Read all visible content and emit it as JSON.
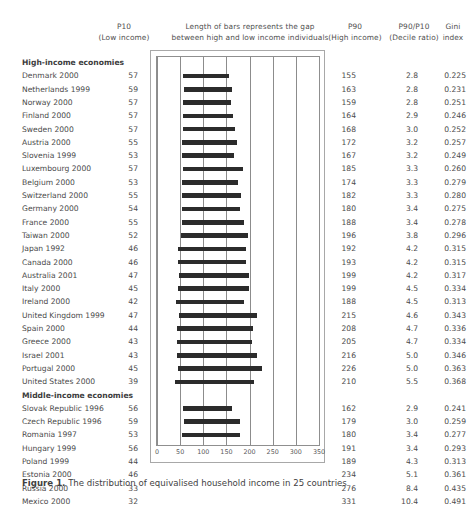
{
  "header": {
    "p10_line1": "P10",
    "p10_line2": "(Low income)",
    "bars_line1": "Length of bars represents the gap",
    "bars_line2": "between high and low income individuals",
    "p90_line1": "P90",
    "p90_line2": "(High income)",
    "ratio_line1": "P90/P10",
    "ratio_line2": "(Decile ratio)",
    "gini_line1": "Gini",
    "gini_line2": "index"
  },
  "caption": {
    "lead": "Figure 1.",
    "text": "The distribution of equivalised household income in 25 countries"
  },
  "axis": {
    "ticks": [
      "0",
      "50",
      "100",
      "150",
      "200",
      "250",
      "300",
      "350"
    ],
    "min": 0,
    "max": 350,
    "step": 50
  },
  "colors": {
    "bar": "#2b2b2b",
    "grid": "#8c8c8c",
    "frame": "#8f8f8f",
    "text": "#4a4a4a",
    "background": "#ffffff"
  },
  "chart_data": {
    "type": "bar",
    "subtype": "range-bar",
    "title": "Length of bars represents the gap between high and low income individuals",
    "xlabel": "",
    "ylabel": "",
    "xlim": [
      0,
      350
    ],
    "grid": true,
    "legend": false,
    "columns": [
      "Country",
      "P10 (Low income)",
      "P90 (High income)",
      "P90/P10 (Decile ratio)",
      "Gini index"
    ],
    "groups": [
      {
        "label": "High-income economies",
        "rows": [
          {
            "name": "Denmark 2000",
            "p10": 57,
            "p90": 155,
            "ratio": "2.8",
            "gini": "0.225"
          },
          {
            "name": "Netherlands 1999",
            "p10": 59,
            "p90": 163,
            "ratio": "2.8",
            "gini": "0.231"
          },
          {
            "name": "Norway 2000",
            "p10": 57,
            "p90": 159,
            "ratio": "2.8",
            "gini": "0.251"
          },
          {
            "name": "Finland 2000",
            "p10": 57,
            "p90": 164,
            "ratio": "2.9",
            "gini": "0.246"
          },
          {
            "name": "Sweden 2000",
            "p10": 57,
            "p90": 168,
            "ratio": "3.0",
            "gini": "0.252"
          },
          {
            "name": "Austria 2000",
            "p10": 55,
            "p90": 172,
            "ratio": "3.2",
            "gini": "0.257"
          },
          {
            "name": "Slovenia 1999",
            "p10": 53,
            "p90": 167,
            "ratio": "3.2",
            "gini": "0.249"
          },
          {
            "name": "Luxembourg 2000",
            "p10": 57,
            "p90": 185,
            "ratio": "3.3",
            "gini": "0.260"
          },
          {
            "name": "Belgium 2000",
            "p10": 53,
            "p90": 174,
            "ratio": "3.3",
            "gini": "0.279"
          },
          {
            "name": "Switzerland 2000",
            "p10": 55,
            "p90": 182,
            "ratio": "3.3",
            "gini": "0.280"
          },
          {
            "name": "Germany 2000",
            "p10": 54,
            "p90": 180,
            "ratio": "3.4",
            "gini": "0.275"
          },
          {
            "name": "France 2000",
            "p10": 55,
            "p90": 188,
            "ratio": "3.4",
            "gini": "0.278"
          },
          {
            "name": "Taiwan 2000",
            "p10": 52,
            "p90": 196,
            "ratio": "3.8",
            "gini": "0.296"
          },
          {
            "name": "Japan 1992",
            "p10": 46,
            "p90": 192,
            "ratio": "4.2",
            "gini": "0.315"
          },
          {
            "name": "Canada 2000",
            "p10": 46,
            "p90": 193,
            "ratio": "4.2",
            "gini": "0.315"
          },
          {
            "name": "Australia 2001",
            "p10": 47,
            "p90": 199,
            "ratio": "4.2",
            "gini": "0.317"
          },
          {
            "name": "Italy 2000",
            "p10": 45,
            "p90": 199,
            "ratio": "4.5",
            "gini": "0.334"
          },
          {
            "name": "Ireland 2000",
            "p10": 42,
            "p90": 188,
            "ratio": "4.5",
            "gini": "0.313"
          },
          {
            "name": "United Kingdom 1999",
            "p10": 47,
            "p90": 215,
            "ratio": "4.6",
            "gini": "0.343"
          },
          {
            "name": "Spain 2000",
            "p10": 44,
            "p90": 208,
            "ratio": "4.7",
            "gini": "0.336"
          },
          {
            "name": "Greece 2000",
            "p10": 43,
            "p90": 205,
            "ratio": "4.7",
            "gini": "0.334"
          },
          {
            "name": "Israel 2001",
            "p10": 43,
            "p90": 216,
            "ratio": "5.0",
            "gini": "0.346"
          },
          {
            "name": "Portugal 2000",
            "p10": 45,
            "p90": 226,
            "ratio": "5.0",
            "gini": "0.363"
          },
          {
            "name": "United States 2000",
            "p10": 39,
            "p90": 210,
            "ratio": "5.5",
            "gini": "0.368"
          }
        ]
      },
      {
        "label": "Middle-income economies",
        "rows": [
          {
            "name": "Slovak Republic 1996",
            "p10": 56,
            "p90": 162,
            "ratio": "2.9",
            "gini": "0.241"
          },
          {
            "name": "Czech Republic 1996",
            "p10": 59,
            "p90": 179,
            "ratio": "3.0",
            "gini": "0.259"
          },
          {
            "name": "Romania 1997",
            "p10": 53,
            "p90": 180,
            "ratio": "3.4",
            "gini": "0.277"
          },
          {
            "name": "Hungary 1999",
            "p10": 56,
            "p90": 191,
            "ratio": "3.4",
            "gini": "0.293"
          },
          {
            "name": "Poland 1999",
            "p10": 44,
            "p90": 189,
            "ratio": "4.3",
            "gini": "0.313"
          },
          {
            "name": "Estonia 2000",
            "p10": 46,
            "p90": 234,
            "ratio": "5.1",
            "gini": "0.361"
          },
          {
            "name": "Russia 2000",
            "p10": 33,
            "p90": 276,
            "ratio": "8.4",
            "gini": "0.435"
          },
          {
            "name": "Mexico 2000",
            "p10": 32,
            "p90": 331,
            "ratio": "10.4",
            "gini": "0.491"
          }
        ]
      }
    ]
  }
}
